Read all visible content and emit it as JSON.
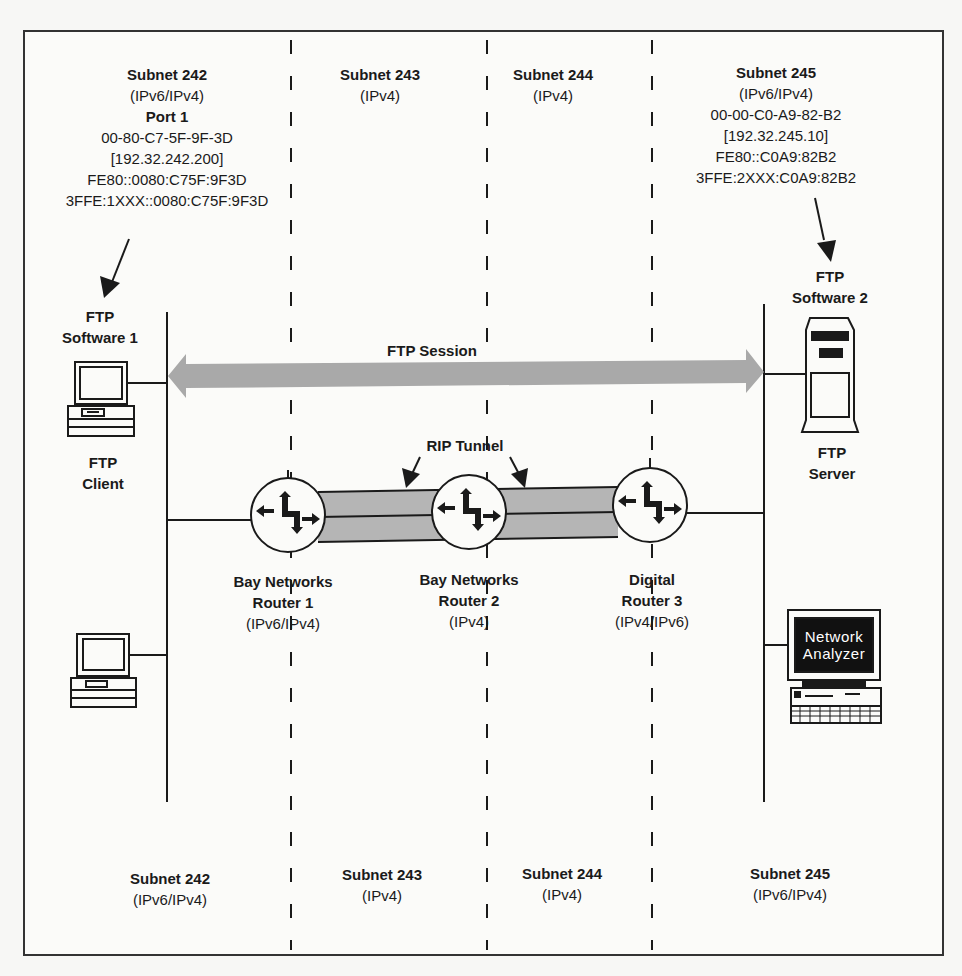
{
  "diagram": {
    "type": "network-topology",
    "colors": {
      "line": "#1a1a1a",
      "session_arrow": "#a9a9a9",
      "tunnel_fill": "#b5b5b5",
      "background": "#fbfbf9",
      "analyzer_screen": "#111111"
    },
    "top_subnets": [
      {
        "name": "Subnet 242",
        "protocol": "(IPv6/IPv4)",
        "port": "Port 1",
        "mac": "00-80-C7-5F-9F-3D",
        "ipv4": "[192.32.242.200]",
        "link_local": "FE80::0080:C75F:9F3D",
        "global": "3FFE:1XXX::0080:C75F:9F3D"
      },
      {
        "name": "Subnet 243",
        "protocol": "(IPv4)"
      },
      {
        "name": "Subnet 244",
        "protocol": "(IPv4)"
      },
      {
        "name": "Subnet 245",
        "protocol": "(IPv6/IPv4)",
        "mac": "00-00-C0-A9-82-B2",
        "ipv4": "[192.32.245.10]",
        "link_local": "FE80::C0A9:82B2",
        "global": "3FFE:2XXX:C0A9:82B2"
      }
    ],
    "bottom_subnets": [
      {
        "name": "Subnet 242",
        "protocol": "(IPv6/IPv4)"
      },
      {
        "name": "Subnet 243",
        "protocol": "(IPv4)"
      },
      {
        "name": "Subnet 244",
        "protocol": "(IPv4)"
      },
      {
        "name": "Subnet 245",
        "protocol": "(IPv6/IPv4)"
      }
    ],
    "client": {
      "software_line1": "FTP",
      "software_line2": "Software 1",
      "role_line1": "FTP",
      "role_line2": "Client"
    },
    "server": {
      "software_line1": "FTP",
      "software_line2": "Software 2",
      "role_line1": "FTP",
      "role_line2": "Server"
    },
    "session": {
      "label": "FTP Session"
    },
    "tunnel": {
      "label": "RIP Tunnel"
    },
    "routers": [
      {
        "vendor": "Bay Networks",
        "name": "Router 1",
        "protocol": "(IPv6/IPv4)"
      },
      {
        "vendor": "Bay Networks",
        "name": "Router 2",
        "protocol": "(IPv4)"
      },
      {
        "vendor": "Digital",
        "name": "Router 3",
        "protocol": "(IPv4/IPv6)"
      }
    ],
    "analyzer": {
      "line1": "Network",
      "line2": "Analyzer"
    }
  }
}
